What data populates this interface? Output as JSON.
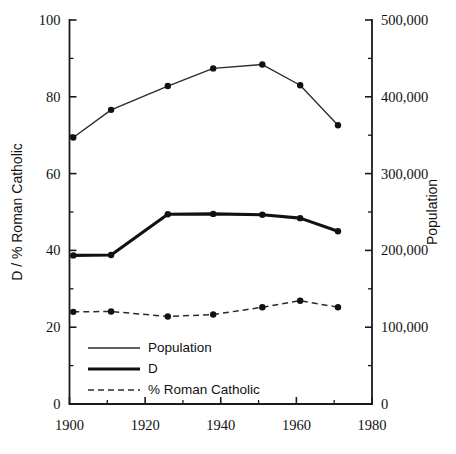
{
  "chart_data": {
    "type": "line",
    "title": "",
    "subtitle": "",
    "xlabel": "",
    "ylabel": "D / % Roman Catholic",
    "y2label": "Population",
    "xlim": [
      1900,
      1980
    ],
    "ylim": [
      0,
      100
    ],
    "y2lim": [
      0,
      500000
    ],
    "grid": false,
    "legend_position": "bottom-left",
    "x_ticks": [
      1900,
      1920,
      1940,
      1960,
      1980
    ],
    "x_tick_labels": [
      "1900",
      "1920",
      "1940",
      "1960",
      "1980"
    ],
    "x_minor_ticks": [
      1910,
      1930,
      1950,
      1970
    ],
    "y_ticks": [
      0,
      20,
      40,
      60,
      80,
      100
    ],
    "y_tick_labels": [
      "0",
      "20",
      "40",
      "60",
      "80",
      "100"
    ],
    "y_minor_ticks": [
      10,
      30,
      50,
      70,
      90
    ],
    "y2_ticks": [
      0,
      100000,
      200000,
      300000,
      400000,
      500000
    ],
    "y2_tick_labels": [
      "0",
      "100,000",
      "200,000",
      "300,000",
      "400,000",
      "500,000"
    ],
    "y2_minor_ticks": [
      50000,
      150000,
      250000,
      350000,
      450000
    ],
    "x": [
      1901,
      1911,
      1926,
      1938,
      1951,
      1961,
      1971
    ],
    "series": [
      {
        "name": "Population",
        "axis": "right",
        "style": "thin-solid",
        "marker": "filled-circle",
        "values": [
          347000,
          383000,
          414000,
          437000,
          442000,
          415000,
          363000
        ],
        "values_left_scale": [
          69.4,
          76.7,
          82.9,
          87.4,
          88.4,
          83.0,
          72.6
        ]
      },
      {
        "name": "D",
        "axis": "left",
        "style": "thick-solid",
        "marker": "filled-circle",
        "values": [
          38.7,
          38.8,
          49.4,
          49.5,
          49.3,
          48.4,
          45.0
        ]
      },
      {
        "name": "% Roman Catholic",
        "axis": "left",
        "style": "dashed",
        "marker": "filled-circle",
        "values": [
          24.0,
          24.1,
          22.8,
          23.3,
          25.2,
          26.9,
          25.2
        ]
      }
    ],
    "legend_entries": [
      {
        "label": "Population",
        "style": "thin-solid"
      },
      {
        "label": "D",
        "style": "thick-solid"
      },
      {
        "label": "% Roman Catholic",
        "style": "dashed"
      }
    ],
    "colors": {
      "axis": "#1a1a1a",
      "population": "#2b2b2b",
      "d": "#111111",
      "roman_catholic": "#2b2b2b",
      "background": "#ffffff"
    }
  }
}
